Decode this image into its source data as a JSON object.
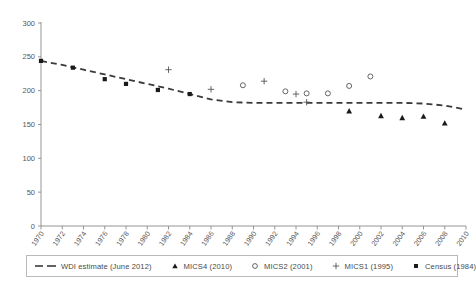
{
  "chart_data": {
    "type": "line",
    "title": "",
    "subtitle": "",
    "xlabel": "",
    "ylabel": "",
    "xlim": [
      1970,
      2010
    ],
    "ylim": [
      0,
      300
    ],
    "yticks": [
      0,
      50,
      100,
      150,
      200,
      250,
      300
    ],
    "xticks": [
      1970,
      1972,
      1974,
      1976,
      1978,
      1980,
      1982,
      1984,
      1986,
      1988,
      1990,
      1992,
      1994,
      1996,
      1998,
      2000,
      2002,
      2004,
      2006,
      2008,
      2010
    ],
    "grid": false,
    "legend_position": "bottom",
    "series": [
      {
        "name": "WDI estimate (June 2012)",
        "marker": "dashed-line",
        "type": "line",
        "color": "#3a3a3a",
        "x": [
          1970,
          1972,
          1974,
          1976,
          1978,
          1980,
          1982,
          1984,
          1986,
          1988,
          1990,
          1992,
          1994,
          1996,
          1998,
          2000,
          2002,
          2004,
          2006,
          2008,
          2010
        ],
        "y": [
          244,
          238,
          231,
          224,
          217,
          210,
          203,
          195,
          187,
          183,
          182,
          182,
          182,
          182,
          182,
          182,
          182,
          182,
          181,
          178,
          172
        ]
      },
      {
        "name": "Census (1984)",
        "marker": "square",
        "type": "scatter",
        "color": "#1a1a1a",
        "x": [
          1970,
          1973,
          1976,
          1978,
          1981,
          1984
        ],
        "y": [
          244,
          234,
          217,
          210,
          201,
          195
        ]
      },
      {
        "name": "MICS1 (1995)",
        "marker": "plus",
        "type": "scatter",
        "color": "#555555",
        "x": [
          1982,
          1986,
          1991,
          1994,
          1995
        ],
        "y": [
          231,
          202,
          214,
          195,
          183
        ]
      },
      {
        "name": "MICS2 (2001)",
        "marker": "circle",
        "type": "scatter",
        "color": "#555555",
        "x": [
          1989,
          1993,
          1995,
          1997,
          1999,
          2001
        ],
        "y": [
          208,
          199,
          196,
          196,
          207,
          221
        ]
      },
      {
        "name": "MICS4 (2010)",
        "marker": "triangle",
        "type": "scatter",
        "color": "#1a1a1a",
        "x": [
          1999,
          2002,
          2004,
          2006,
          2008
        ],
        "y": [
          170,
          163,
          160,
          162,
          152
        ]
      }
    ]
  },
  "legend": {
    "items": [
      {
        "label": "WDI estimate (June 2012)",
        "marker": "dashed-line"
      },
      {
        "label": "MICS4 (2010)",
        "marker": "triangle"
      },
      {
        "label": "MICS2 (2001)",
        "marker": "circle"
      },
      {
        "label": "MICS1 (1995)",
        "marker": "plus"
      },
      {
        "label": "Census (1984)",
        "marker": "square"
      }
    ]
  },
  "axes": {
    "y_tick_labels": [
      "0",
      "50",
      "100",
      "150",
      "200",
      "250",
      "300"
    ],
    "x_tick_labels": [
      "1970",
      "1972",
      "1974",
      "1976",
      "1978",
      "1980",
      "1982",
      "1984",
      "1986",
      "1988",
      "1990",
      "1992",
      "1994",
      "1996",
      "1998",
      "2000",
      "2002",
      "2004",
      "2006",
      "2008",
      "2010"
    ]
  },
  "colors": {
    "axis": "#8a8a8a",
    "series_dark": "#1a1a1a",
    "series_mid": "#555555",
    "legend_border": "#b9b9b9"
  }
}
